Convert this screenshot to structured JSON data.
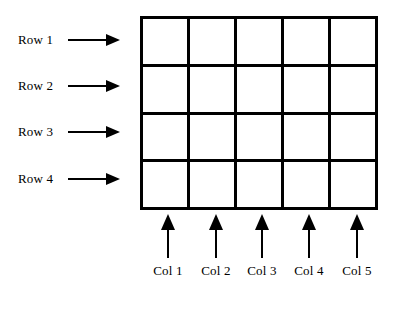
{
  "figure": {
    "type": "grid-schematic",
    "title": "",
    "background_color": "#FFFFFF",
    "line_color": "#000000",
    "text_color": "#000000",
    "grid": {
      "rows": 4,
      "cols": 5,
      "cell_count": 20,
      "cell_fill": "#FFFFFF",
      "border_width_px": 3,
      "bounds": {
        "x": 140,
        "y": 16,
        "width": 238,
        "height": 194
      }
    },
    "row_labels": [
      {
        "label": "Row 1",
        "index": 1,
        "arrow": "right-arrow"
      },
      {
        "label": "Row 2",
        "index": 2,
        "arrow": "right-arrow"
      },
      {
        "label": "Row 3",
        "index": 3,
        "arrow": "right-arrow"
      },
      {
        "label": "Row 4",
        "index": 4,
        "arrow": "right-arrow"
      }
    ],
    "col_labels": [
      {
        "label": "Col 1",
        "index": 1,
        "arrow": "up-arrow"
      },
      {
        "label": "Col 2",
        "index": 2,
        "arrow": "up-arrow"
      },
      {
        "label": "Col 3",
        "index": 3,
        "arrow": "up-arrow"
      },
      {
        "label": "Col 4",
        "index": 4,
        "arrow": "up-arrow"
      },
      {
        "label": "Col 5",
        "index": 5,
        "arrow": "up-arrow"
      }
    ]
  }
}
